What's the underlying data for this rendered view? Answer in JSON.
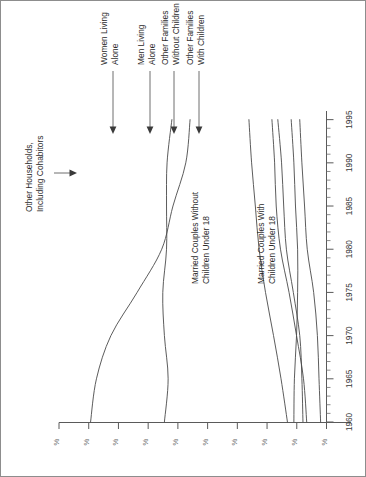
{
  "figure": {
    "border_color": "#8d8d8d",
    "line_color": "#4a4a4a",
    "background": "#ffffff",
    "rotation_degrees": 90,
    "note": "chart is printed rotated 90 degrees counter-clockwise on the page"
  },
  "chart_data": {
    "type": "line",
    "title": "",
    "xlabel": "",
    "ylabel": "%",
    "xlim": [
      1960,
      1996
    ],
    "ylim": [
      0,
      50
    ],
    "grid": false,
    "legend_position": "inline-labels-with-leader-arrows",
    "x": [
      1960,
      1965,
      1970,
      1975,
      1980,
      1985,
      1990,
      1995
    ],
    "xticks": [
      "1960",
      "1965",
      "1970",
      "1975",
      "1980",
      "1985",
      "1990",
      "1995"
    ],
    "minor_tick_interval_years": 1,
    "yticks": [
      "%",
      "%",
      "%",
      "%",
      "%",
      "%",
      "%",
      "%",
      "%",
      "%"
    ],
    "ytick_note": "numeric portion of the percent labels is cropped off the page edge; only the % glyphs are visible",
    "series": [
      {
        "name": "Married Couples With Children Under 18",
        "label_placement": "inline",
        "values": [
          44.1,
          43.0,
          40.3,
          35.4,
          30.8,
          28.7,
          26.3,
          25.5
        ]
      },
      {
        "name": "Married Couples Without Children Under 18",
        "label_placement": "inline",
        "values": [
          30.3,
          29.6,
          30.3,
          30.6,
          29.9,
          29.9,
          29.8,
          28.9
        ]
      },
      {
        "name": "Other Families With Children",
        "label_placement": "leader-arrow",
        "values": [
          4.4,
          4.6,
          5.0,
          6.2,
          7.5,
          8.0,
          8.4,
          9.1
        ]
      },
      {
        "name": "Other Families Without Children",
        "label_placement": "leader-arrow",
        "values": [
          6.1,
          6.0,
          5.6,
          5.4,
          5.4,
          5.8,
          6.1,
          6.6
        ]
      },
      {
        "name": "Men Living Alone",
        "label_placement": "leader-arrow",
        "values": [
          3.7,
          4.3,
          5.6,
          7.0,
          8.6,
          9.4,
          9.7,
          10.2
        ]
      },
      {
        "name": "Women Living Alone",
        "label_placement": "leader-arrow",
        "values": [
          7.3,
          8.5,
          9.9,
          11.4,
          12.6,
          13.3,
          14.0,
          14.5
        ]
      },
      {
        "name": "Other Households, Including Cohabitors",
        "label_placement": "leader-arrow",
        "values": [
          1.1,
          1.4,
          1.7,
          2.4,
          3.6,
          4.1,
          4.6,
          5.0
        ]
      }
    ]
  },
  "annotations": {
    "women_living_alone": "Women Living\nAlone",
    "women_living_alone_line1": "Women Living",
    "women_living_alone_line2": "Alone",
    "men_living_alone_line1": "Men Living",
    "men_living_alone_line2": "Alone",
    "other_families_without_line1": "Other Families",
    "other_families_without_line2": "Without Children",
    "other_families_with_line1": "Other Families",
    "other_families_with_line2": "With Children",
    "other_households_line1": "Other Households,",
    "other_households_line2": "Including Cohabitors",
    "married_without_line1": "Married Couples Without",
    "married_without_line2": "Children Under 18",
    "married_with_line1": "Married Couples With",
    "married_with_line2": "Children Under 18"
  },
  "axis": {
    "years": [
      "1960",
      "1965",
      "1970",
      "1975",
      "1980",
      "1985",
      "1990",
      "1995"
    ],
    "percent_labels": [
      "%",
      "%",
      "%",
      "%",
      "%",
      "%",
      "%",
      "%",
      "%",
      "%"
    ]
  }
}
